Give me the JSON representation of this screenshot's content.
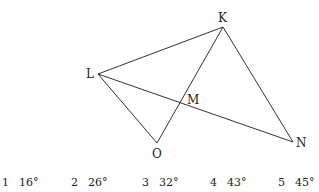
{
  "diagram": {
    "points": {
      "K": {
        "label": "K",
        "x": 223,
        "y": 27
      },
      "L": {
        "label": "L",
        "x": 98,
        "y": 74
      },
      "M": {
        "label": "M",
        "x": 182,
        "y": 102
      },
      "O": {
        "label": "O",
        "x": 157,
        "y": 143
      },
      "N": {
        "label": "N",
        "x": 293,
        "y": 142
      }
    },
    "segments": [
      [
        "L",
        "K"
      ],
      [
        "K",
        "N"
      ],
      [
        "L",
        "N"
      ],
      [
        "L",
        "O"
      ],
      [
        "O",
        "K"
      ]
    ]
  },
  "options": [
    {
      "num": "1",
      "value": "16°"
    },
    {
      "num": "2",
      "value": "26°"
    },
    {
      "num": "3",
      "value": "32°"
    },
    {
      "num": "4",
      "value": "43°"
    },
    {
      "num": "5",
      "value": "45°"
    }
  ]
}
